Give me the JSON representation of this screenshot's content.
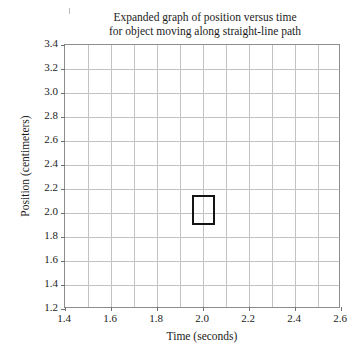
{
  "chart_data": {
    "type": "line",
    "title": "Expanded graph of position versus time for object moving along straight-line path",
    "title_lines": [
      "Expanded graph of position versus time",
      "for object moving along straight-line path"
    ],
    "xlabel": "Time (seconds)",
    "ylabel": "Position (centimeters)",
    "xlim": [
      1.4,
      2.6
    ],
    "ylim": [
      1.2,
      3.4
    ],
    "xticks": [
      "1.4",
      "1.6",
      "1.8",
      "2.0",
      "2.2",
      "2.4",
      "2.6"
    ],
    "xtick_values": [
      1.4,
      1.6,
      1.8,
      2.0,
      2.2,
      2.4,
      2.6
    ],
    "yticks": [
      "3.4",
      "3.2",
      "3.0",
      "2.8",
      "2.6",
      "2.4",
      "2.2",
      "2.0",
      "1.8",
      "1.6",
      "1.4",
      "1.2"
    ],
    "ytick_values": [
      3.4,
      3.2,
      3.0,
      2.8,
      2.6,
      2.4,
      2.2,
      2.0,
      1.8,
      1.6,
      1.4,
      1.2
    ],
    "grid": true,
    "grid_x_step": 0.1,
    "grid_y_step": 0.2,
    "legend": null,
    "series": [],
    "annotations": [
      {
        "name": "highlight-box",
        "type": "rectangle",
        "x0": 1.95,
        "x1": 2.05,
        "y0": 1.9,
        "y1": 2.15,
        "color": "#141414",
        "filled": false
      }
    ],
    "colors": {
      "grid": "#c2c2c2",
      "frame": "#8d8d8d",
      "text": "#1b1b1b",
      "highlight": "#141414",
      "background": "#ffffff"
    }
  }
}
